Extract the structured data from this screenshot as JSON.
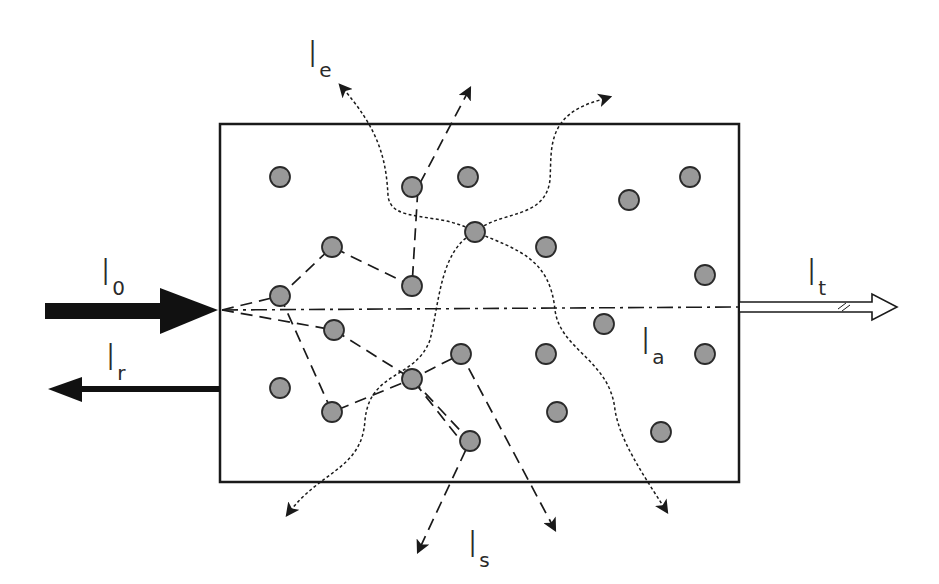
{
  "figure": {
    "colors": {
      "stroke": "#1a1a1a",
      "particle_fill": "#999999",
      "particle_stroke": "#2a2a2a",
      "background": "#ffffff"
    }
  },
  "labels": {
    "incident": {
      "main": "I",
      "sub": "0"
    },
    "reflected": {
      "main": "I",
      "sub": "r"
    },
    "transmitted": {
      "main": "I",
      "sub": "t"
    },
    "emitted": {
      "main": "I",
      "sub": "e"
    },
    "scattered": {
      "main": "I",
      "sub": "s"
    },
    "absorbed": {
      "main": "I",
      "sub": "a"
    }
  },
  "legend_semantics": {
    "incident_arrow": "thick solid black arrow entering medium",
    "reflected_arrow": "solid black arrow leaving left face",
    "transmitted_arrow": "hollow double-line arrow leaving right face",
    "scattering_paths": "dashed lines between particles",
    "emission_paths": "dotted wavy lines",
    "direct_path": "dash-dot line through medium"
  },
  "medium": {
    "x": 220,
    "y": 124,
    "width": 519,
    "height": 358
  },
  "particles": [
    [
      280,
      177
    ],
    [
      412,
      187
    ],
    [
      468,
      177
    ],
    [
      629,
      200
    ],
    [
      690,
      177
    ],
    [
      475,
      232
    ],
    [
      332,
      247
    ],
    [
      546,
      247
    ],
    [
      412,
      286
    ],
    [
      280,
      296
    ],
    [
      705,
      275
    ],
    [
      334,
      330
    ],
    [
      604,
      324
    ],
    [
      461,
      354
    ],
    [
      546,
      354
    ],
    [
      705,
      354
    ],
    [
      280,
      388
    ],
    [
      412,
      379
    ],
    [
      332,
      412
    ],
    [
      557,
      412
    ],
    [
      661,
      432
    ],
    [
      470,
      441
    ]
  ]
}
